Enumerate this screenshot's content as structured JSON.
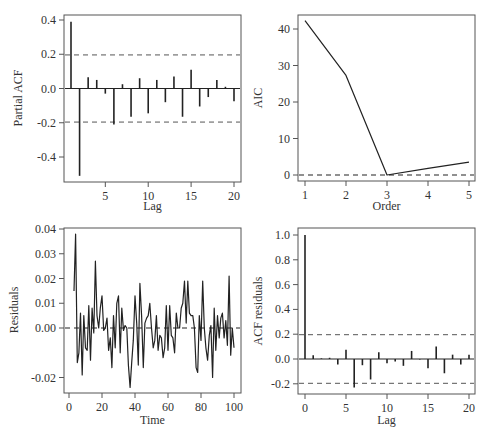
{
  "chart_data": [
    {
      "id": "pacf",
      "type": "bar",
      "subtype": "stem",
      "title": "",
      "xlabel": "Lag",
      "ylabel": "Partial ACF",
      "xlim": [
        0.2,
        20.8
      ],
      "ylim": [
        -0.54,
        0.43
      ],
      "xticks": [
        5,
        10,
        15,
        20
      ],
      "yticks": [
        -0.4,
        -0.2,
        0.0,
        0.2,
        0.4
      ],
      "ytick_labels": [
        "-0.4",
        "-0.2",
        "0.0",
        "0.2",
        "0.4"
      ],
      "conf_bounds": [
        0.196,
        -0.196
      ],
      "x": [
        1,
        2,
        3,
        4,
        5,
        6,
        7,
        8,
        9,
        10,
        11,
        12,
        13,
        14,
        15,
        16,
        17,
        18,
        19,
        20
      ],
      "values": [
        0.39,
        -0.51,
        0.065,
        0.05,
        -0.03,
        -0.21,
        0.025,
        -0.165,
        0.06,
        -0.145,
        0.05,
        -0.08,
        0.07,
        -0.165,
        0.11,
        -0.105,
        -0.05,
        0.05,
        0.01,
        -0.075
      ],
      "grid": false
    },
    {
      "id": "aic",
      "type": "line",
      "title": "",
      "xlabel": "Order",
      "ylabel": "AIC",
      "xlim": [
        0.85,
        5.2
      ],
      "ylim": [
        -1.5,
        44
      ],
      "xticks": [
        1,
        2,
        3,
        4,
        5
      ],
      "yticks": [
        0,
        10,
        20,
        30,
        40
      ],
      "reference_line": 0,
      "x": [
        1,
        2,
        3,
        4,
        5
      ],
      "values": [
        42.3,
        27.3,
        0.0,
        1.8,
        3.5
      ],
      "grid": false
    },
    {
      "id": "residuals",
      "type": "line",
      "title": "",
      "xlabel": "Time",
      "ylabel": "Residuals",
      "xlim": [
        -3,
        104
      ],
      "ylim": [
        -0.0265,
        0.0405
      ],
      "xticks": [
        0,
        20,
        40,
        60,
        80,
        100
      ],
      "yticks": [
        -0.02,
        0.0,
        0.01,
        0.02,
        0.03,
        0.04
      ],
      "ytick_labels": [
        "-0.02",
        "0.00",
        "0.01",
        "0.02",
        "0.03",
        "0.04"
      ],
      "reference_line": 0,
      "x": [
        3,
        4,
        5,
        6,
        7,
        8,
        9,
        10,
        11,
        12,
        13,
        14,
        15,
        16,
        17,
        18,
        19,
        20,
        21,
        22,
        23,
        24,
        25,
        26,
        27,
        28,
        29,
        30,
        31,
        32,
        33,
        34,
        35,
        36,
        37,
        38,
        39,
        40,
        41,
        42,
        43,
        44,
        45,
        46,
        47,
        48,
        49,
        50,
        51,
        52,
        53,
        54,
        55,
        56,
        57,
        58,
        59,
        60,
        61,
        62,
        63,
        64,
        65,
        66,
        67,
        68,
        69,
        70,
        71,
        72,
        73,
        74,
        75,
        76,
        77,
        78,
        79,
        80,
        81,
        82,
        83,
        84,
        85,
        86,
        87,
        88,
        89,
        90,
        91,
        92,
        93,
        94,
        95,
        96,
        97,
        98,
        99,
        100
      ],
      "values": [
        0.015,
        0.038,
        -0.014,
        -0.01,
        0.006,
        -0.019,
        0.005,
        -0.008,
        -0.009,
        0.009,
        -0.013,
        0.008,
        -0.002,
        0.027,
        0.005,
        0.0,
        0.008,
        0.013,
        -0.001,
        0.0,
        0.004,
        -0.009,
        -0.004,
        -0.016,
        0.005,
        -0.008,
        0.01,
        0.013,
        -0.01,
        0.008,
        -0.001,
        0.001,
        0.0,
        -0.015,
        -0.024,
        -0.014,
        -0.005,
        0.013,
        0.002,
        -0.015,
        0.018,
        0.005,
        -0.016,
        0.002,
        0.004,
        0.005,
        0.01,
        0.0,
        -0.008,
        -0.005,
        0.005,
        -0.009,
        -0.003,
        -0.004,
        -0.012,
        -0.008,
        0.009,
        -0.009,
        0.009,
        -0.003,
        -0.004,
        -0.01,
        0.006,
        0.0,
        0.0,
        0.008,
        0.01,
        0.019,
        0.002,
        0.019,
        0.006,
        0.005,
        0.005,
        0.0,
        -0.016,
        -0.018,
        0.005,
        -0.005,
        0.019,
        0.0,
        -0.008,
        -0.013,
        -0.003,
        0.001,
        -0.02,
        0.008,
        -0.009,
        0.005,
        -0.004,
        0.004,
        0.006,
        -0.004,
        0.003,
        -0.007,
        0.021,
        -0.011,
        0.0,
        -0.008
      ],
      "grid": false
    },
    {
      "id": "acf_residuals",
      "type": "bar",
      "subtype": "stem",
      "title": "",
      "xlabel": "Lag",
      "ylabel": "ACF residuals",
      "xlim": [
        -0.9,
        20.7
      ],
      "ylim": [
        -0.28,
        1.05
      ],
      "xticks": [
        0,
        5,
        10,
        15,
        20
      ],
      "yticks": [
        -0.2,
        0.0,
        0.2,
        0.4,
        0.6,
        0.8,
        1.0
      ],
      "ytick_labels": [
        "-0.2",
        "0.0",
        "0.2",
        "0.4",
        "0.6",
        "0.8",
        "1.0"
      ],
      "conf_bounds": [
        0.196,
        -0.196
      ],
      "x": [
        0,
        1,
        2,
        3,
        4,
        5,
        6,
        7,
        8,
        9,
        10,
        11,
        12,
        13,
        14,
        15,
        16,
        17,
        18,
        19,
        20
      ],
      "values": [
        1.0,
        0.03,
        0.005,
        0.01,
        -0.045,
        0.075,
        -0.23,
        -0.05,
        -0.165,
        0.055,
        -0.035,
        -0.02,
        -0.055,
        0.065,
        -0.005,
        -0.075,
        0.1,
        -0.115,
        0.035,
        -0.045,
        0.035
      ],
      "grid": false
    }
  ],
  "panels": {
    "pacf": {
      "xlabel": "Lag",
      "ylabel": "Partial ACF",
      "xtick_labels": [
        "5",
        "10",
        "15",
        "20"
      ],
      "ytick_labels": [
        "-0.4",
        "-0.2",
        "0.0",
        "0.2",
        "0.4"
      ]
    },
    "aic": {
      "xlabel": "Order",
      "ylabel": "AIC",
      "xtick_labels": [
        "1",
        "2",
        "3",
        "4",
        "5"
      ],
      "ytick_labels": [
        "0",
        "10",
        "20",
        "30",
        "40"
      ]
    },
    "residuals": {
      "xlabel": "Time",
      "ylabel": "Residuals",
      "xtick_labels": [
        "0",
        "20",
        "40",
        "60",
        "80",
        "100"
      ],
      "ytick_labels": [
        "-0.02",
        "0.00",
        "0.01",
        "0.02",
        "0.03",
        "0.04"
      ]
    },
    "acf_residuals": {
      "xlabel": "Lag",
      "ylabel": "ACF residuals",
      "xtick_labels": [
        "0",
        "5",
        "10",
        "15",
        "20"
      ],
      "ytick_labels": [
        "-0.2",
        "0.0",
        "0.2",
        "0.4",
        "0.6",
        "0.8",
        "1.0"
      ]
    }
  },
  "colors": {
    "line": "#222222",
    "frame": "#555555",
    "dashed": "#555555",
    "text": "#333333",
    "background": "#ffffff"
  }
}
